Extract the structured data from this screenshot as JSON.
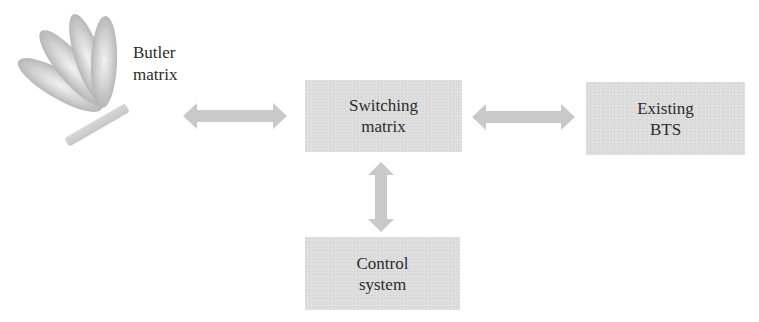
{
  "diagram": {
    "type": "block-diagram",
    "antenna": {
      "label_line1": "Butler",
      "label_line2": "matrix",
      "icon": "beam-lobes-antenna-icon",
      "lobe_count": 4
    },
    "nodes": [
      {
        "id": "switching",
        "line1": "Switching",
        "line2": "matrix"
      },
      {
        "id": "bts",
        "line1": "Existing",
        "line2": "BTS"
      },
      {
        "id": "control",
        "line1": "Control",
        "line2": "system"
      }
    ],
    "edges": [
      {
        "from": "antenna",
        "to": "switching",
        "direction": "bidirectional"
      },
      {
        "from": "switching",
        "to": "bts",
        "direction": "bidirectional"
      },
      {
        "from": "switching",
        "to": "control",
        "direction": "bidirectional"
      }
    ],
    "colors": {
      "box_fill": "#dddddd",
      "arrow_fill": "#c8c8c8",
      "lobe_fill": "#bdbdbd",
      "text": "#2b2b2b",
      "background": "#ffffff"
    }
  }
}
